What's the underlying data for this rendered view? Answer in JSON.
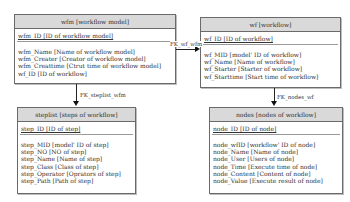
{
  "entities": {
    "wfm": {
      "title": "wfm [workflow model]",
      "pk": "wfm_ID [ID of workflow model]",
      "attributes": [
        "wfm_Name [Name of workflow model]",
        "wfm_Creater [Creator of workflow model]",
        "wfm_Creattime [Ctrut time of workflow model]",
        "wf_ID [ID of workflow]"
      ]
    },
    "wf": {
      "title": "wf [workflow]",
      "pk": "wf_ID [ID of workflow]",
      "attributes": [
        "wf_MID [model' ID of workflow]",
        "wf_Name [Name of workflow]",
        "wf_Starter [Starter of workflow]",
        "wf_Starttime [Start time of workflow]"
      ]
    },
    "steplist": {
      "title": "steplist [steps of workflow]",
      "pk": "step_ID [ID of step]",
      "attributes": [
        "step_MID [model' ID of step]",
        "step_NO [NO of step]",
        "step_Name [Name of step]",
        "step_Class [Class of step]",
        "step_Operator [Oprators of step]",
        "step_Path [Path of step]"
      ]
    },
    "nodes": {
      "title": "nodes [nodes of workflow]",
      "pk": "node_ID [ID of node]",
      "attributes": [
        "node_wfID [workflow' ID of node]",
        "node_Name [Name of node]",
        "node_User [Users of node]",
        "node_Time [Execute time of node]",
        "node_Content [Content of node]",
        "node_Value [Execute result of node]"
      ]
    }
  },
  "relationships": {
    "fk_wf_wfm": "FK_wf_wfm",
    "fk_steplist_wfm": "FK_steplist_wfm",
    "fk_nodes_wf": "FK_nodes_wf"
  },
  "colors": {
    "header_bg": "#d9d9d9",
    "border": "#6a6a6a",
    "line": "#222222"
  }
}
